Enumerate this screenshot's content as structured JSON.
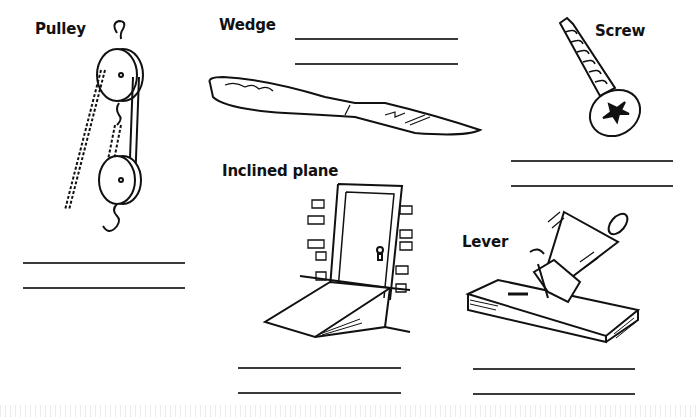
{
  "worksheet": {
    "items": [
      {
        "label": "Pulley",
        "icon": "pulley-icon"
      },
      {
        "label": "Wedge",
        "icon": "knife-wedge-icon"
      },
      {
        "label": "Screw",
        "icon": "screw-icon"
      },
      {
        "label": "Inclined plane",
        "icon": "ramp-door-icon"
      },
      {
        "label": "Lever",
        "icon": "hammer-nail-icon"
      }
    ]
  },
  "colors": {
    "ink": "#111111",
    "line": "#3a3a3a",
    "background": "#ffffff"
  }
}
